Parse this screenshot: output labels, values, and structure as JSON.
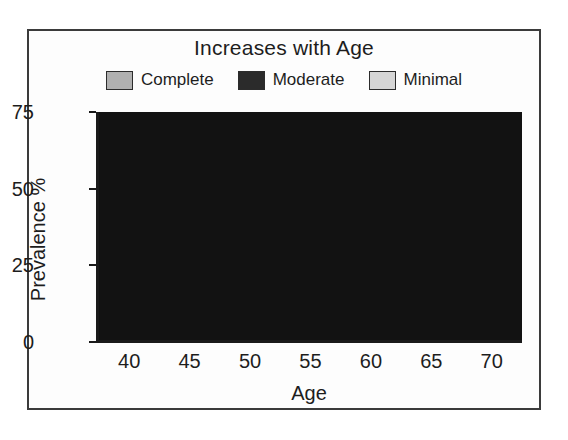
{
  "chart_data": {
    "type": "bar",
    "subtype": "stacked-bar",
    "title": "Increases with Age",
    "xlabel": "Age",
    "ylabel": "Prevalence %",
    "categories": [
      "40",
      "45",
      "50",
      "55",
      "60",
      "65",
      "70"
    ],
    "yticks": [
      "0",
      "25",
      "50",
      "75"
    ],
    "ytick_values": [
      0,
      25,
      50,
      75
    ],
    "ylim": [
      0,
      75
    ],
    "grid": false,
    "legend_position": "top",
    "stack_order_bottom_to_top": [
      "Minimal",
      "Moderate",
      "Complete"
    ],
    "series": [
      {
        "name": "Minimal",
        "values": [
          23,
          23,
          23,
          23,
          23,
          23,
          23
        ]
      },
      {
        "name": "Moderate",
        "values": [
          17,
          22,
          23,
          26,
          28,
          31,
          33.5
        ]
      },
      {
        "name": "Complete",
        "values": [
          6.5,
          6,
          9.5,
          11,
          12.5,
          16,
          18.5
        ]
      }
    ],
    "cumulative_totals": [
      46.5,
      51,
      55.5,
      60,
      63.5,
      70,
      75
    ],
    "plot_background": "#121212"
  },
  "legend": {
    "items": [
      {
        "label": "Complete",
        "color": "#b0b0b0"
      },
      {
        "label": "Moderate",
        "color": "#2b2b2b"
      },
      {
        "label": "Minimal",
        "color": "#d6d6d6"
      }
    ]
  },
  "bar_colors": {
    "Minimal": "#d8d8d8",
    "Moderate": "#8f8f8f",
    "Complete": "#bcbcbc"
  }
}
